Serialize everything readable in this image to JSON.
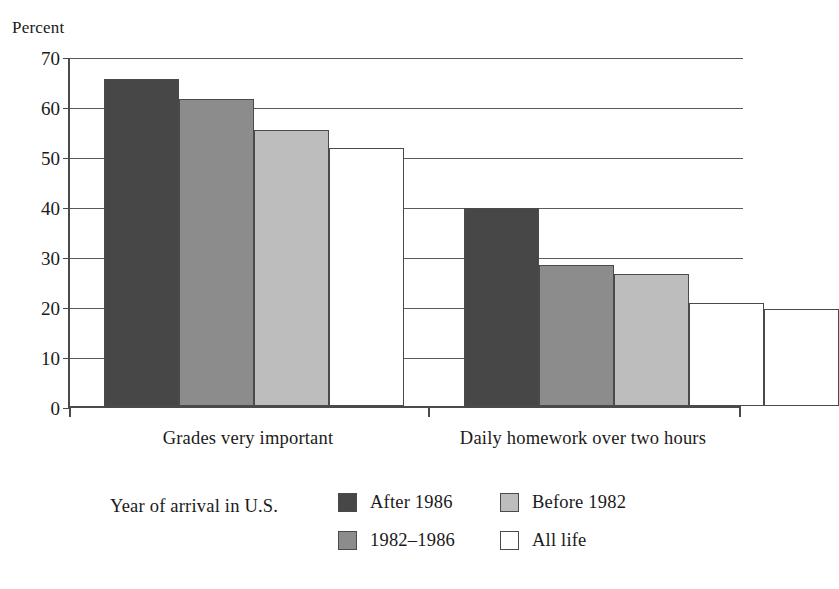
{
  "chart_data": {
    "type": "bar",
    "title": "",
    "subtitle": "",
    "xlabel": "",
    "ylabel": "Percent",
    "ylim": [
      0,
      70
    ],
    "ytick_step": 10,
    "yticks": [
      0,
      10,
      20,
      30,
      40,
      50,
      60,
      70
    ],
    "grid": true,
    "legend_position": "bottom",
    "legend_title": "Year of arrival in U.S.",
    "categories": [
      "Grades very important",
      "Daily homework over two hours"
    ],
    "series": [
      {
        "name": "After 1986",
        "color": "#474747",
        "values": [
          65.5,
          39.7
        ]
      },
      {
        "name": "1982–1986",
        "color": "#8c8c8c",
        "values": [
          61.5,
          28.2
        ]
      },
      {
        "name": "Before 1982",
        "color": "#bdbdbd",
        "values": [
          55.3,
          26.5
        ]
      },
      {
        "name": "All life",
        "color": "#ffffff",
        "values": [
          51.6,
          20.7
        ]
      }
    ],
    "extra_bar": {
      "name": "All life",
      "color": "#ffffff",
      "value": 19.4
    }
  },
  "axis": {
    "y_title": "Percent",
    "y_tick_labels": [
      "70",
      "60",
      "50",
      "40",
      "30",
      "20",
      "10",
      "0"
    ],
    "category_labels": [
      "Grades very important",
      "Daily homework over two hours"
    ]
  },
  "legend": {
    "title": "Year of arrival in U.S.",
    "entries": [
      {
        "label": "After 1986"
      },
      {
        "label": "Before 1982"
      },
      {
        "label": "1982–1986"
      },
      {
        "label": "All life"
      }
    ]
  }
}
